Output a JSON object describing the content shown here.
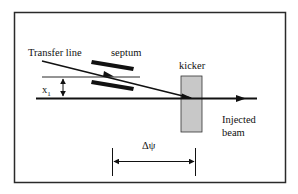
{
  "diagram": {
    "labels": {
      "transfer_line": "Transfer line",
      "septum": "septum",
      "kicker": "kicker",
      "x1_main": "x",
      "x1_sub": "1",
      "injected_beam_line1": "Injected",
      "injected_beam_line2": "beam",
      "phase_advance": "Δψ"
    },
    "colors": {
      "frame": "#2a2a2a",
      "lines": "#111111",
      "kicker_fill": "#c8c8c8",
      "background": "#ffffff"
    }
  }
}
